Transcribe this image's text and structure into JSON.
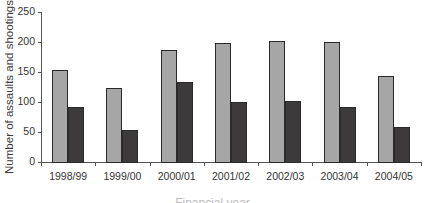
{
  "chart_data": {
    "type": "bar",
    "title": "",
    "xlabel": "Financial year",
    "ylabel": "Number of assaults and shootings",
    "ylim": [
      0,
      250
    ],
    "yticks": [
      0,
      50,
      100,
      150,
      200,
      250
    ],
    "grid": false,
    "legend": null,
    "categories": [
      "1998/99",
      "1999/00",
      "2000/01",
      "2001/02",
      "2002/03",
      "2003/04",
      "2004/05"
    ],
    "series": [
      {
        "name": "Series 1 (light grey)",
        "color": "#a6a6a6",
        "values": [
          153,
          123,
          187,
          198,
          202,
          200,
          143
        ]
      },
      {
        "name": "Series 2 (dark grey)",
        "color": "#3d3a3b",
        "values": [
          92,
          53,
          133,
          100,
          102,
          92,
          58
        ]
      }
    ]
  }
}
